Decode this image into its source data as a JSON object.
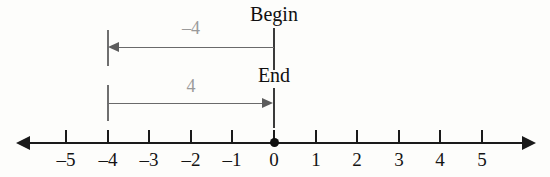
{
  "figure": {
    "type": "number-line-diagram",
    "background_color": "#fdfdfb",
    "axis_color": "#1a1a1a",
    "annotation_color": "#6a6a6a",
    "label_color": "#9a9a9a"
  },
  "number_line": {
    "ticks": [
      {
        "value": -5,
        "label": "–5",
        "x": 66
      },
      {
        "value": -4,
        "label": "–4",
        "x": 108
      },
      {
        "value": -3,
        "label": "–3",
        "x": 149
      },
      {
        "value": -2,
        "label": "–2",
        "x": 191
      },
      {
        "value": -1,
        "label": "–1",
        "x": 232
      },
      {
        "value": 0,
        "label": "0",
        "x": 274
      },
      {
        "value": 1,
        "label": "1",
        "x": 316
      },
      {
        "value": 2,
        "label": "2",
        "x": 357
      },
      {
        "value": 3,
        "label": "3",
        "x": 399
      },
      {
        "value": 4,
        "label": "4",
        "x": 440
      },
      {
        "value": 5,
        "label": "5",
        "x": 482
      }
    ],
    "origin_marker": {
      "value": 0,
      "x": 274
    },
    "left_arrowhead": true,
    "right_arrowhead": true
  },
  "annotations": {
    "upper": {
      "label": "–4",
      "endpoint_label": "Begin",
      "from_value": 0,
      "to_value": -4,
      "direction": "left",
      "from_x": 274,
      "to_x": 108,
      "y": 47
    },
    "lower": {
      "label": "4",
      "endpoint_label": "End",
      "from_value": -4,
      "to_value": 0,
      "direction": "right",
      "from_x": 108,
      "to_x": 274,
      "y": 103
    }
  }
}
